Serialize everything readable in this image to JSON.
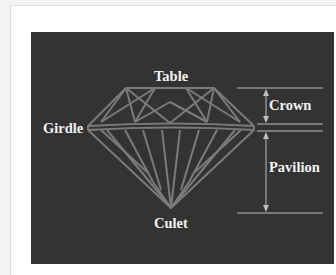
{
  "diagram": {
    "labels": {
      "table": "Table",
      "girdle": "Girdle",
      "crown": "Crown",
      "pavilion": "Pavilion",
      "culet": "Culet"
    },
    "colors": {
      "background": "#333333",
      "facet_lines": "#7a7a7a",
      "guide_lines": "#bdbdbd",
      "label_text": "#f2f2f2",
      "card": "#ffffff"
    }
  }
}
